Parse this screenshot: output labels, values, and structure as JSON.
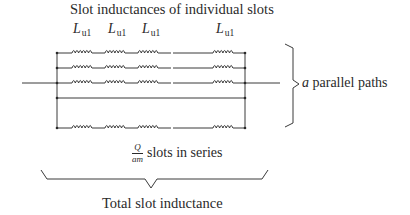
{
  "diagram": {
    "title": "Slot inductances of individual slots",
    "inductor_labels": [
      {
        "main": "L",
        "sub": "u1"
      },
      {
        "main": "L",
        "sub": "u1"
      },
      {
        "main": "L",
        "sub": "u1"
      },
      {
        "main": "L",
        "sub": "u1"
      }
    ],
    "parallel_label": {
      "var": "a",
      "text": " parallel paths"
    },
    "series_label": {
      "numerator": "Q",
      "denominator": "am",
      "text": "slots in series"
    },
    "total_label": "Total slot inductance",
    "rows": [
      {
        "type": "coils",
        "y": 53
      },
      {
        "type": "coils",
        "y": 68
      },
      {
        "type": "coils",
        "y": 83
      },
      {
        "type": "wire",
        "y": 98
      },
      {
        "type": "coils",
        "y": 128
      }
    ],
    "colors": {
      "line": "#3a3a3a",
      "text": "#2a2a2a"
    }
  }
}
